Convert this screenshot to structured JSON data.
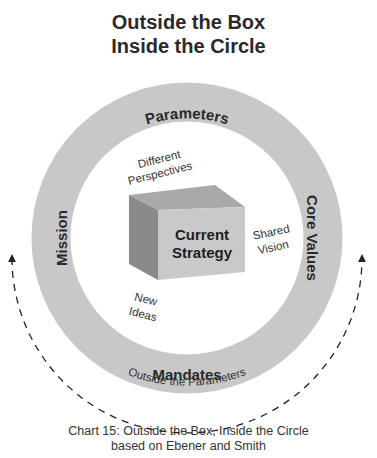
{
  "title": {
    "line1": "Outside the Box",
    "line2": "Inside the Circle"
  },
  "ring": {
    "top": "Parameters",
    "right": "Core Values",
    "bottom": "Mandates",
    "left": "Mission",
    "fill_color": "#c8c8c8"
  },
  "center_box": {
    "line1": "Current",
    "line2": "Strategy",
    "front_color": "#c9c9c9",
    "top_color": "#a9a9a9",
    "side_color": "#8a8a8a"
  },
  "inner_labels": {
    "different_perspectives": {
      "line1": "Different",
      "line2": "Perspectives"
    },
    "shared_vision": {
      "line1": "Shared",
      "line2": "Vision"
    },
    "new_ideas": {
      "line1": "New",
      "line2": "Ideas"
    }
  },
  "outside_arc": {
    "label": "Outside the Parameters"
  },
  "caption": {
    "line1": "Chart 15: Outside the Box, Inside the Circle",
    "line2": "based on Ebener and Smith"
  }
}
